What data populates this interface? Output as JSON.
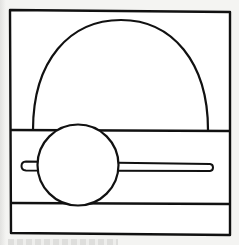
{
  "diagram": {
    "type": "line-drawing",
    "stroke_color": "#111111",
    "fill_color": "#ffffff",
    "background_color": "#f4f4f2",
    "elements": {
      "frame": {
        "x": 10,
        "y": 10,
        "width": 220,
        "height": 224
      },
      "semicircle": {
        "cx": 120,
        "cy": 130,
        "rx": 88,
        "ry": 109
      },
      "band_top_line": {
        "y": 130
      },
      "band_bottom_line": {
        "y": 203
      },
      "small_circle": {
        "cx": 78,
        "cy": 165,
        "r": 40
      },
      "bar": {
        "x1": 21,
        "x2": 213,
        "y_top": 162,
        "y_bottom": 171
      }
    }
  },
  "caption": {
    "visible": "illegible"
  }
}
